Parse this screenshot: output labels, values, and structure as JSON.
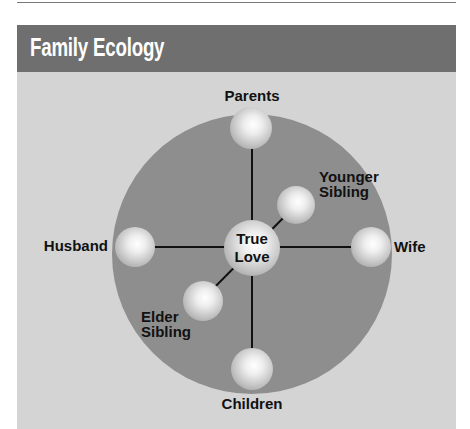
{
  "header": {
    "title": "Family Ecology"
  },
  "colors": {
    "header_bg": "#6f6f6f",
    "panel_bg": "#d4d4d4",
    "circle": "#8e8e8e",
    "line": "#111111"
  },
  "diagram": {
    "center": {
      "label_line1": "True",
      "label_line2": "Love"
    },
    "nodes": [
      {
        "id": "parents",
        "label": "Parents"
      },
      {
        "id": "children",
        "label": "Children"
      },
      {
        "id": "husband",
        "label": "Husband"
      },
      {
        "id": "wife",
        "label": "Wife"
      },
      {
        "id": "younger",
        "label_line1": "Younger",
        "label_line2": "Sibling"
      },
      {
        "id": "elder",
        "label_line1": "Elder",
        "label_line2": "Sibling"
      }
    ]
  }
}
